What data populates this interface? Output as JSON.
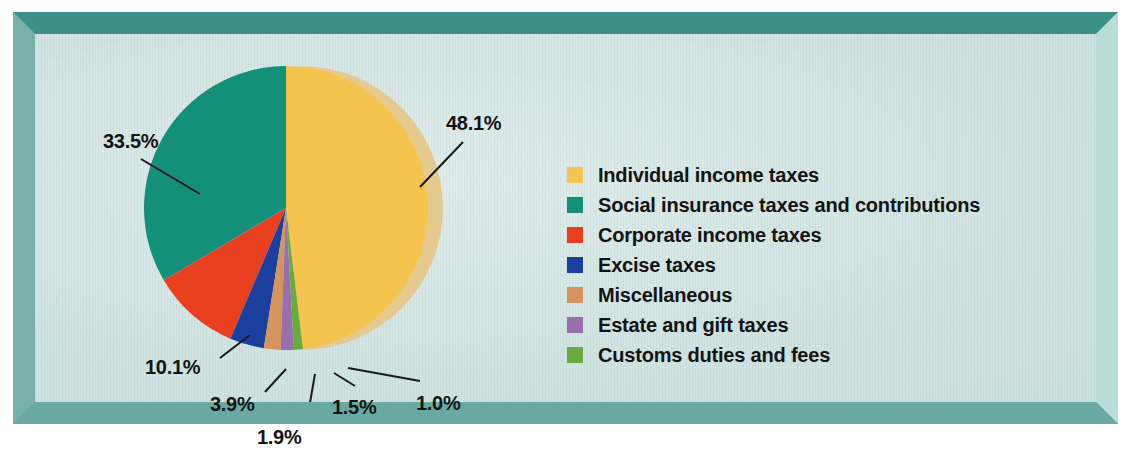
{
  "frame": {
    "border_color": "#3d9088",
    "border_highlight": "#b9dcd8",
    "panel_bg": "#cfe2e1"
  },
  "chart_data": {
    "type": "pie",
    "title": "",
    "subtitle": "",
    "xlabel": "",
    "ylabel": "",
    "grid": false,
    "legend_position": "right",
    "start_angle_deg": 0,
    "direction": "clockwise",
    "units": "percent",
    "total": 100.0,
    "categories": [
      "Individual income taxes",
      "Social insurance taxes and contributions",
      "Corporate income taxes",
      "Excise taxes",
      "Miscellaneous",
      "Estate and gift taxes",
      "Customs duties and fees"
    ],
    "values": [
      48.1,
      33.5,
      10.1,
      3.9,
      1.9,
      1.5,
      1.0
    ],
    "labels": [
      "48.1%",
      "33.5%",
      "10.1%",
      "3.9%",
      "1.9%",
      "1.5%",
      "1.0%"
    ],
    "colors": [
      "#f5c44f",
      "#14907a",
      "#e8401f",
      "#1b3f9e",
      "#d4945a",
      "#9a6fae",
      "#6aab3c"
    ]
  },
  "pie": {
    "center_x": 251,
    "center_y": 174,
    "radius": 142,
    "depth_offset_x": 15,
    "depth_color": "#e6c98e",
    "labels": [
      {
        "name": "individual-income-taxes",
        "text": "48.1%",
        "x": 411,
        "y": 78,
        "leader": {
          "x1": 428,
          "y1": 108,
          "x2": 385,
          "y2": 153
        }
      },
      {
        "name": "social-insurance",
        "text": "33.5%",
        "x": 68,
        "y": 96,
        "leader": {
          "x1": 106,
          "y1": 125,
          "x2": 165,
          "y2": 160
        }
      },
      {
        "name": "corporate-income-taxes",
        "text": "10.1%",
        "x": 110,
        "y": 322,
        "leader": {
          "x1": 185,
          "y1": 324,
          "x2": 215,
          "y2": 301
        }
      },
      {
        "name": "excise-taxes",
        "text": "3.9%",
        "x": 175,
        "y": 359,
        "leader": {
          "x1": 230,
          "y1": 358,
          "x2": 251,
          "y2": 335
        }
      },
      {
        "name": "miscellaneous",
        "text": "1.9%",
        "x": 222,
        "y": 392,
        "leader": {
          "x1": 272,
          "y1": 386,
          "x2": 280,
          "y2": 340
        }
      },
      {
        "name": "estate-and-gift-taxes",
        "text": "1.5%",
        "x": 297,
        "y": 362,
        "leader": {
          "x1": 320,
          "y1": 352,
          "x2": 299,
          "y2": 339
        }
      },
      {
        "name": "customs-duties-and-fees",
        "text": "1.0%",
        "x": 381,
        "y": 358,
        "leader": {
          "x1": 385,
          "y1": 347,
          "x2": 313,
          "y2": 334
        }
      }
    ]
  },
  "legend": {
    "items": [
      {
        "label": "Individual income taxes",
        "color": "#f5c44f"
      },
      {
        "label": "Social insurance taxes and contributions",
        "color": "#14907a"
      },
      {
        "label": "Corporate income taxes",
        "color": "#e8401f"
      },
      {
        "label": "Excise taxes",
        "color": "#1b3f9e"
      },
      {
        "label": "Miscellaneous",
        "color": "#d4945a"
      },
      {
        "label": "Estate and gift taxes",
        "color": "#9a6fae"
      },
      {
        "label": "Customs duties and fees",
        "color": "#6aab3c"
      }
    ]
  }
}
